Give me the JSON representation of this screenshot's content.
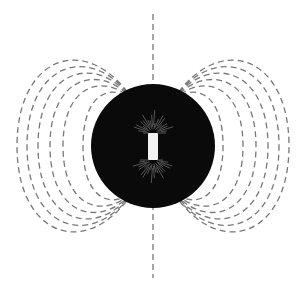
{
  "diagram": {
    "colors": {
      "background": "#ffffff",
      "sphere": "#0a0a0a",
      "field_line": "#777777",
      "magnet": "#f2f2f2",
      "inner_sparks": "#bdbdbd"
    },
    "sphere": {
      "cx": 153,
      "cy": 146,
      "r": 62
    },
    "magnet": {
      "x": 148,
      "y": 133,
      "width": 10,
      "height": 27
    },
    "axis_line": {
      "x": 153,
      "y1": 14,
      "y2": 278
    },
    "field_loops_offsets": [
      70,
      90,
      103,
      115,
      126,
      136
    ]
  }
}
